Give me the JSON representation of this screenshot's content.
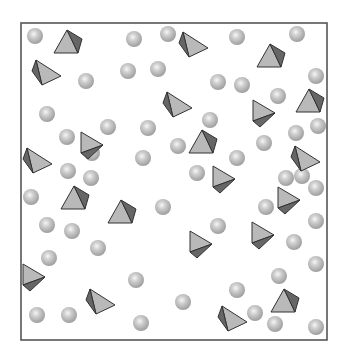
{
  "diagram": {
    "box": {
      "x": 21,
      "y": 23,
      "w": 306,
      "h": 317,
      "stroke": "#555555"
    },
    "colors": {
      "sphere": "#b8b8b8",
      "sphere_highlight": "#f4f4f4",
      "tet_light": "#b9b9b9",
      "tet_dark": "#666666",
      "edge": "#333333"
    },
    "spheres": [
      [
        35,
        36
      ],
      [
        134,
        39
      ],
      [
        168,
        34
      ],
      [
        237,
        37
      ],
      [
        297,
        34
      ],
      [
        86,
        81
      ],
      [
        128,
        71
      ],
      [
        158,
        69
      ],
      [
        218,
        82
      ],
      [
        242,
        85
      ],
      [
        316,
        76
      ],
      [
        47,
        114
      ],
      [
        108,
        127
      ],
      [
        148,
        128
      ],
      [
        210,
        120
      ],
      [
        278,
        96
      ],
      [
        296,
        133
      ],
      [
        318,
        126
      ],
      [
        67,
        137
      ],
      [
        92,
        153
      ],
      [
        143,
        158
      ],
      [
        178,
        146
      ],
      [
        197,
        173
      ],
      [
        237,
        158
      ],
      [
        264,
        143
      ],
      [
        302,
        176
      ],
      [
        31,
        197
      ],
      [
        68,
        171
      ],
      [
        91,
        178
      ],
      [
        163,
        207
      ],
      [
        266,
        207
      ],
      [
        286,
        178
      ],
      [
        316,
        188
      ],
      [
        47,
        225
      ],
      [
        72,
        231
      ],
      [
        98,
        248
      ],
      [
        218,
        226
      ],
      [
        294,
        242
      ],
      [
        316,
        221
      ],
      [
        49,
        258
      ],
      [
        136,
        280
      ],
      [
        237,
        290
      ],
      [
        279,
        276
      ],
      [
        316,
        264
      ],
      [
        37,
        315
      ],
      [
        69,
        315
      ],
      [
        141,
        323
      ],
      [
        183,
        302
      ],
      [
        255,
        313
      ],
      [
        275,
        324
      ],
      [
        316,
        327
      ]
    ],
    "tetrahedra": [
      {
        "x": 68,
        "y": 43,
        "type": "up"
      },
      {
        "x": 46,
        "y": 74,
        "type": "left"
      },
      {
        "x": 193,
        "y": 46,
        "type": "left"
      },
      {
        "x": 271,
        "y": 57,
        "type": "up"
      },
      {
        "x": 177,
        "y": 106,
        "type": "left"
      },
      {
        "x": 263,
        "y": 113,
        "type": "down"
      },
      {
        "x": 310,
        "y": 102,
        "type": "up"
      },
      {
        "x": 91,
        "y": 145,
        "type": "down"
      },
      {
        "x": 203,
        "y": 143,
        "type": "up"
      },
      {
        "x": 37,
        "y": 162,
        "type": "left"
      },
      {
        "x": 223,
        "y": 179,
        "type": "down"
      },
      {
        "x": 305,
        "y": 160,
        "type": "left"
      },
      {
        "x": 75,
        "y": 199,
        "type": "up"
      },
      {
        "x": 122,
        "y": 213,
        "type": "up"
      },
      {
        "x": 288,
        "y": 200,
        "type": "down"
      },
      {
        "x": 200,
        "y": 244,
        "type": "down"
      },
      {
        "x": 262,
        "y": 235,
        "type": "down"
      },
      {
        "x": 33,
        "y": 277,
        "type": "down"
      },
      {
        "x": 100,
        "y": 303,
        "type": "left"
      },
      {
        "x": 285,
        "y": 302,
        "type": "up"
      },
      {
        "x": 232,
        "y": 320,
        "type": "left"
      }
    ]
  }
}
